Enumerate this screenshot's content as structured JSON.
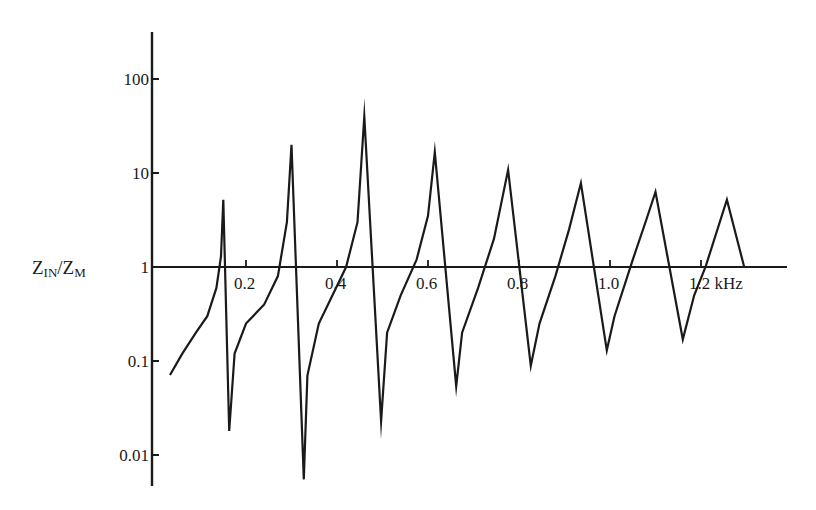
{
  "chart_data": {
    "type": "line",
    "title": "",
    "xlabel": "kHz",
    "ylabel": "Z_IN/Z_M",
    "ylabel_main_1": "Z",
    "ylabel_sub_1": "IN",
    "ylabel_slash": "/Z",
    "ylabel_sub_2": "M",
    "yscale": "log",
    "ylim": [
      0.005,
      250
    ],
    "xlim": [
      0,
      1.4
    ],
    "grid": false,
    "y_ticks": [
      {
        "value": 100,
        "label": "100"
      },
      {
        "value": 10,
        "label": "10"
      },
      {
        "value": 1,
        "label": "1"
      },
      {
        "value": 0.1,
        "label": "0.1"
      },
      {
        "value": 0.01,
        "label": "0.01"
      }
    ],
    "x_ticks": [
      {
        "value": 0.2,
        "label": "0.2"
      },
      {
        "value": 0.4,
        "label": "0.4"
      },
      {
        "value": 0.6,
        "label": "0.6"
      },
      {
        "value": 0.8,
        "label": "0.8"
      },
      {
        "value": 1.0,
        "label": "1.0"
      },
      {
        "value": 1.2,
        "label": "1.2 kHz"
      }
    ],
    "series": [
      {
        "name": "Z_IN/Z_M",
        "points": [
          [
            0.033,
            0.071
          ],
          [
            0.06,
            0.12
          ],
          [
            0.09,
            0.2
          ],
          [
            0.115,
            0.3
          ],
          [
            0.135,
            0.6
          ],
          [
            0.145,
            1.3
          ],
          [
            0.15,
            5.2
          ],
          [
            0.163,
            0.018
          ],
          [
            0.175,
            0.12
          ],
          [
            0.2,
            0.25
          ],
          [
            0.24,
            0.4
          ],
          [
            0.27,
            0.8
          ],
          [
            0.29,
            3.0
          ],
          [
            0.3,
            20
          ],
          [
            0.327,
            0.0055
          ],
          [
            0.335,
            0.07
          ],
          [
            0.36,
            0.25
          ],
          [
            0.39,
            0.5
          ],
          [
            0.42,
            1.0
          ],
          [
            0.445,
            3.0
          ],
          [
            0.46,
            40
          ],
          [
            0.497,
            0.023
          ],
          [
            0.51,
            0.2
          ],
          [
            0.54,
            0.5
          ],
          [
            0.575,
            1.2
          ],
          [
            0.6,
            3.5
          ],
          [
            0.615,
            16.7
          ],
          [
            0.662,
            0.054
          ],
          [
            0.675,
            0.2
          ],
          [
            0.71,
            0.6
          ],
          [
            0.745,
            2.0
          ],
          [
            0.776,
            10.8
          ],
          [
            0.826,
            0.089
          ],
          [
            0.845,
            0.25
          ],
          [
            0.88,
            0.8
          ],
          [
            0.91,
            2.5
          ],
          [
            0.936,
            7.8
          ],
          [
            0.993,
            0.13
          ],
          [
            1.01,
            0.3
          ],
          [
            1.05,
            1.2
          ],
          [
            1.08,
            3.2
          ],
          [
            1.1,
            6.3
          ],
          [
            1.16,
            0.17
          ],
          [
            1.185,
            0.5
          ],
          [
            1.21,
            1.0
          ],
          [
            1.257,
            5.2
          ],
          [
            1.295,
            1.0
          ]
        ],
        "peaks": [
          {
            "f_khz": 0.15,
            "value": 5.2
          },
          {
            "f_khz": 0.3,
            "value": 20
          },
          {
            "f_khz": 0.46,
            "value": 40
          },
          {
            "f_khz": 0.615,
            "value": 16.7
          },
          {
            "f_khz": 0.776,
            "value": 10.8
          },
          {
            "f_khz": 0.936,
            "value": 7.8
          },
          {
            "f_khz": 1.1,
            "value": 6.3
          },
          {
            "f_khz": 1.257,
            "value": 5.2
          }
        ],
        "troughs": [
          {
            "f_khz": 0.163,
            "value": 0.018
          },
          {
            "f_khz": 0.327,
            "value": 0.0055
          },
          {
            "f_khz": 0.497,
            "value": 0.023
          },
          {
            "f_khz": 0.662,
            "value": 0.054
          },
          {
            "f_khz": 0.826,
            "value": 0.089
          },
          {
            "f_khz": 0.993,
            "value": 0.13
          },
          {
            "f_khz": 1.16,
            "value": 0.17
          }
        ],
        "color": "#1a1a1a"
      }
    ],
    "layout": {
      "axis_origin_px": [
        155,
        267
      ],
      "px_per_khz": 455,
      "px_per_decade": 94,
      "y_axis_px": {
        "x": 152,
        "top": 32,
        "bottom": 486
      },
      "x_axis_px": {
        "left": 152,
        "right": 787
      }
    }
  }
}
